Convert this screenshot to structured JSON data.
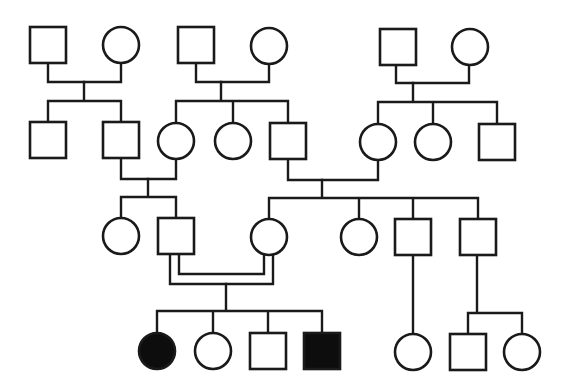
{
  "diagram": {
    "type": "pedigree",
    "colors": {
      "line": "#1a1a1a",
      "unaffected_fill": "#ffffff",
      "affected_fill": "#0d0d0d",
      "background": "#ffffff"
    },
    "legend": {
      "square": "male",
      "circle": "female",
      "filled": "affected",
      "double_line": "consanguineous mating"
    },
    "generations": [
      {
        "label": "I",
        "individuals": [
          {
            "id": "I-1",
            "sex": "male",
            "affected": false,
            "cx": 48,
            "cy": 45
          },
          {
            "id": "I-2",
            "sex": "female",
            "affected": false,
            "cx": 121,
            "cy": 45
          },
          {
            "id": "I-3",
            "sex": "male",
            "affected": false,
            "cx": 196,
            "cy": 45
          },
          {
            "id": "I-4",
            "sex": "female",
            "affected": false,
            "cx": 269,
            "cy": 46
          },
          {
            "id": "I-5",
            "sex": "male",
            "affected": false,
            "cx": 398,
            "cy": 47
          },
          {
            "id": "I-6",
            "sex": "female",
            "affected": false,
            "cx": 470,
            "cy": 47
          }
        ]
      },
      {
        "label": "II",
        "individuals": [
          {
            "id": "II-1",
            "sex": "male",
            "affected": false,
            "cx": 48,
            "cy": 140
          },
          {
            "id": "II-2",
            "sex": "male",
            "affected": false,
            "cx": 121,
            "cy": 140
          },
          {
            "id": "II-3",
            "sex": "female",
            "affected": false,
            "cx": 176,
            "cy": 141
          },
          {
            "id": "II-4",
            "sex": "female",
            "affected": false,
            "cx": 233,
            "cy": 141
          },
          {
            "id": "II-5",
            "sex": "male",
            "affected": false,
            "cx": 288,
            "cy": 141
          },
          {
            "id": "II-6",
            "sex": "female",
            "affected": false,
            "cx": 378,
            "cy": 142
          },
          {
            "id": "II-7",
            "sex": "female",
            "affected": false,
            "cx": 433,
            "cy": 142
          },
          {
            "id": "II-8",
            "sex": "male",
            "affected": false,
            "cx": 497,
            "cy": 142
          }
        ]
      },
      {
        "label": "III",
        "individuals": [
          {
            "id": "III-1",
            "sex": "female",
            "affected": false,
            "cx": 121,
            "cy": 236
          },
          {
            "id": "III-2",
            "sex": "male",
            "affected": false,
            "cx": 176,
            "cy": 236
          },
          {
            "id": "III-3",
            "sex": "female",
            "affected": false,
            "cx": 269,
            "cy": 237
          },
          {
            "id": "III-4",
            "sex": "female",
            "affected": false,
            "cx": 359,
            "cy": 237
          },
          {
            "id": "III-5",
            "sex": "male",
            "affected": false,
            "cx": 413,
            "cy": 237
          },
          {
            "id": "III-6",
            "sex": "male",
            "affected": false,
            "cx": 478,
            "cy": 237
          }
        ]
      },
      {
        "label": "IV",
        "individuals": [
          {
            "id": "IV-1",
            "sex": "female",
            "affected": true,
            "cx": 157,
            "cy": 351
          },
          {
            "id": "IV-2",
            "sex": "female",
            "affected": false,
            "cx": 213,
            "cy": 351
          },
          {
            "id": "IV-3",
            "sex": "male",
            "affected": false,
            "cx": 268,
            "cy": 351
          },
          {
            "id": "IV-4",
            "sex": "male",
            "affected": true,
            "cx": 322,
            "cy": 351
          },
          {
            "id": "IV-5",
            "sex": "female",
            "affected": false,
            "cx": 413,
            "cy": 352
          },
          {
            "id": "IV-6",
            "sex": "male",
            "affected": false,
            "cx": 468,
            "cy": 352
          },
          {
            "id": "IV-7",
            "sex": "female",
            "affected": false,
            "cx": 522,
            "cy": 352
          }
        ]
      }
    ],
    "matings": [
      {
        "partners": [
          "I-1",
          "I-2"
        ],
        "consanguineous": false,
        "children": [
          "II-1",
          "II-2"
        ]
      },
      {
        "partners": [
          "I-3",
          "I-4"
        ],
        "consanguineous": false,
        "children": [
          "II-3",
          "II-4",
          "II-5"
        ]
      },
      {
        "partners": [
          "I-5",
          "I-6"
        ],
        "consanguineous": false,
        "children": [
          "II-6",
          "II-7",
          "II-8"
        ]
      },
      {
        "partners": [
          "II-2",
          "II-3"
        ],
        "consanguineous": false,
        "children": [
          "III-1",
          "III-2"
        ]
      },
      {
        "partners": [
          "II-5",
          "II-6"
        ],
        "consanguineous": false,
        "children": [
          "III-3",
          "III-4",
          "III-5",
          "III-6"
        ]
      },
      {
        "partners": [
          "III-2",
          "III-3"
        ],
        "consanguineous": true,
        "children": [
          "IV-1",
          "IV-2",
          "IV-3",
          "IV-4"
        ]
      },
      {
        "partners": [
          "III-5"
        ],
        "consanguineous": false,
        "children": [
          "IV-5"
        ]
      },
      {
        "partners": [
          "III-6"
        ],
        "consanguineous": false,
        "children": [
          "IV-6",
          "IV-7"
        ]
      }
    ]
  }
}
